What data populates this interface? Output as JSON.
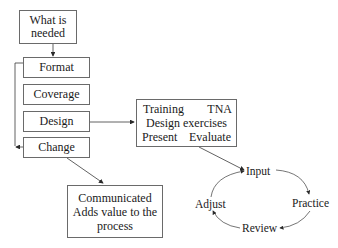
{
  "diagram": {
    "left_column": {
      "top": {
        "line1": "What is",
        "line2": "needed"
      },
      "steps": [
        {
          "label": "Format"
        },
        {
          "label": "Coverage"
        },
        {
          "label": "Design"
        },
        {
          "label": "Change"
        }
      ]
    },
    "training_box": {
      "row1": {
        "left": "Training",
        "right": "TNA"
      },
      "row2": {
        "center": "Design exercises"
      },
      "row3": {
        "left": "Present",
        "right": "Evaluate"
      }
    },
    "outcome_box": {
      "line1": "Communicated",
      "line2": "Adds value to the",
      "line3": "process"
    },
    "cycle": {
      "nodes": [
        "Input",
        "Practice",
        "Review",
        "Adjust"
      ]
    },
    "colors": {
      "line": "#3a3a3a",
      "box_border": "#6a6a6a",
      "text": "#1a1a1a"
    }
  }
}
